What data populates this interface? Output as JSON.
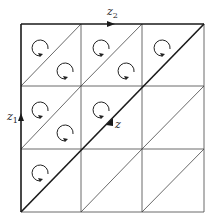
{
  "diagram": {
    "grid": {
      "left": 21,
      "top": 24,
      "right": 204,
      "bottom": 212,
      "cols": 3,
      "rows": 3,
      "col_lines": [
        81,
        142
      ],
      "row_lines": [
        86,
        149
      ]
    },
    "labels": {
      "z2": {
        "base": "z",
        "sub": "2"
      },
      "z1": {
        "base": "z",
        "sub": "1"
      },
      "z": {
        "base": "z"
      }
    },
    "circulation_cells": [
      {
        "row": 0,
        "col": 0,
        "positions": [
          "upper",
          "lower"
        ]
      },
      {
        "row": 0,
        "col": 1,
        "positions": [
          "upper",
          "lower"
        ]
      },
      {
        "row": 0,
        "col": 2,
        "positions": [
          "upper"
        ]
      },
      {
        "row": 1,
        "col": 0,
        "positions": [
          "upper",
          "lower"
        ]
      },
      {
        "row": 1,
        "col": 1,
        "positions": [
          "upper"
        ]
      },
      {
        "row": 2,
        "col": 0,
        "positions": [
          "upper"
        ]
      }
    ],
    "colors": {
      "line": "#333333",
      "thick_line": "#1a1a1a",
      "background": "#ffffff"
    }
  }
}
